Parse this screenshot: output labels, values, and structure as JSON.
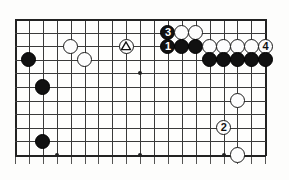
{
  "figure": {
    "kind": "go-board-diagram",
    "board_columns": 19,
    "board_rows_visible": 11,
    "colors": {
      "black_stone": "#111111",
      "white_stone": "#fdfdfd",
      "stone_outline": "#1a1a1a",
      "grid_line": "#3a3a3a",
      "board_edge": "#222222",
      "background": "#fdfdfc"
    }
  },
  "grid": {
    "origin_x": 15,
    "origin_y": 19,
    "spacing_x": 13.9,
    "spacing_y": 13.6,
    "columns": 19,
    "rows": 11,
    "star_points": [
      {
        "col": 3,
        "row": 10
      },
      {
        "col": 9,
        "row": 10
      },
      {
        "col": 15,
        "row": 10
      },
      {
        "col": 9,
        "row": 4
      }
    ]
  },
  "stones": [
    {
      "id": "w-c4r2",
      "color": "white",
      "col": 4,
      "row": 2,
      "label": "",
      "mark": ""
    },
    {
      "id": "w-c8r2",
      "color": "white",
      "col": 8,
      "row": 2,
      "label": "",
      "mark": "triangle"
    },
    {
      "id": "b-c11r1",
      "color": "black",
      "col": 11,
      "row": 1,
      "label": "3",
      "mark": "number"
    },
    {
      "id": "w-c12r1",
      "color": "white",
      "col": 12,
      "row": 1,
      "label": "",
      "mark": ""
    },
    {
      "id": "w-c13r1",
      "color": "white",
      "col": 13,
      "row": 1,
      "label": "",
      "mark": ""
    },
    {
      "id": "b-c1r3",
      "color": "black",
      "col": 1,
      "row": 3,
      "label": "",
      "mark": ""
    },
    {
      "id": "w-c5r3",
      "color": "white",
      "col": 5,
      "row": 3,
      "label": "",
      "mark": ""
    },
    {
      "id": "b-c11r2",
      "color": "black",
      "col": 11,
      "row": 2,
      "label": "1",
      "mark": "number"
    },
    {
      "id": "b-c12r2",
      "color": "black",
      "col": 12,
      "row": 2,
      "label": "",
      "mark": ""
    },
    {
      "id": "b-c13r2",
      "color": "black",
      "col": 13,
      "row": 2,
      "label": "",
      "mark": ""
    },
    {
      "id": "w-c14r2",
      "color": "white",
      "col": 14,
      "row": 2,
      "label": "",
      "mark": ""
    },
    {
      "id": "w-c15r2",
      "color": "white",
      "col": 15,
      "row": 2,
      "label": "",
      "mark": ""
    },
    {
      "id": "w-c16r2",
      "color": "white",
      "col": 16,
      "row": 2,
      "label": "",
      "mark": ""
    },
    {
      "id": "w-c17r2",
      "color": "white",
      "col": 17,
      "row": 2,
      "label": "",
      "mark": ""
    },
    {
      "id": "w-c18r2",
      "color": "white",
      "col": 18,
      "row": 2,
      "label": "4",
      "mark": "number"
    },
    {
      "id": "b-c14r3",
      "color": "black",
      "col": 14,
      "row": 3,
      "label": "",
      "mark": ""
    },
    {
      "id": "b-c15r3",
      "color": "black",
      "col": 15,
      "row": 3,
      "label": "",
      "mark": ""
    },
    {
      "id": "b-c16r3",
      "color": "black",
      "col": 16,
      "row": 3,
      "label": "",
      "mark": ""
    },
    {
      "id": "b-c17r3",
      "color": "black",
      "col": 17,
      "row": 3,
      "label": "",
      "mark": ""
    },
    {
      "id": "b-c18r3",
      "color": "black",
      "col": 18,
      "row": 3,
      "label": "",
      "mark": ""
    },
    {
      "id": "b-c2r5",
      "color": "black",
      "col": 2,
      "row": 5,
      "label": "",
      "mark": ""
    },
    {
      "id": "w-c16r6",
      "color": "white",
      "col": 16,
      "row": 6,
      "label": "",
      "mark": ""
    },
    {
      "id": "w-c15r8",
      "color": "white",
      "col": 15,
      "row": 8,
      "label": "2",
      "mark": "number"
    },
    {
      "id": "b-c2r9",
      "color": "black",
      "col": 2,
      "row": 9,
      "label": "",
      "mark": ""
    },
    {
      "id": "w-c16r10",
      "color": "white",
      "col": 16,
      "row": 10,
      "label": "",
      "mark": ""
    }
  ],
  "moves": [
    {
      "number": "1",
      "color": "black"
    },
    {
      "number": "2",
      "color": "white"
    },
    {
      "number": "3",
      "color": "black"
    },
    {
      "number": "4",
      "color": "white"
    }
  ],
  "marks": [
    {
      "type": "triangle",
      "color": "white",
      "col": 8,
      "row": 2
    }
  ]
}
